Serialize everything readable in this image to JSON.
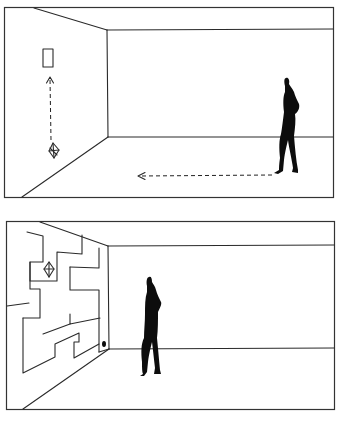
{
  "figure": {
    "panels": [
      {
        "id": "top",
        "label": "room-with-target-rectangle",
        "elements": [
          "rectangle-target",
          "dashed-arrow-up",
          "octahedron-object",
          "dashed-arrow-left",
          "standing-person"
        ]
      },
      {
        "id": "bottom",
        "label": "room-with-maze-wall",
        "elements": [
          "maze-lines",
          "octahedron-object",
          "black-dot",
          "standing-person"
        ]
      }
    ],
    "colors": {
      "line": "#2a2a2a",
      "silhouette": "#0d0d0d",
      "background": "#ffffff"
    }
  }
}
